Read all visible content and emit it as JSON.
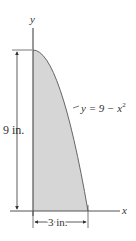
{
  "diagram": {
    "axes": {
      "x_label": "x",
      "y_label": "y"
    },
    "curve": {
      "equation_lhs": "y = 9 − x",
      "equation_exp": "2"
    },
    "dimensions": {
      "height_label": "9 in.",
      "width_label": "3 in."
    },
    "colors": {
      "fill": "#d6d6d6",
      "line": "#555555",
      "text": "#333333"
    }
  }
}
